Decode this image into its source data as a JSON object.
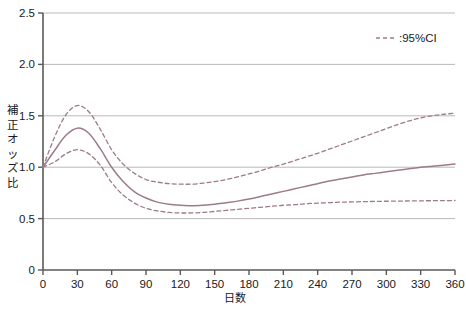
{
  "chart_data": {
    "type": "line",
    "title": "",
    "xlabel": "日数",
    "ylabel": "補正オッズ比",
    "xlim": [
      0,
      360
    ],
    "ylim": [
      0,
      2.5
    ],
    "grid": true,
    "grid_axis": "y",
    "legend": {
      "position": "top-right",
      "entries": [
        {
          "label": ":95%CI",
          "style": "dashed",
          "color": "#9d7a8c"
        }
      ]
    },
    "xticks": [
      0,
      30,
      60,
      90,
      120,
      150,
      180,
      210,
      240,
      270,
      300,
      330,
      360
    ],
    "xtick_labels": [
      "0",
      "30",
      "60",
      "90",
      "120",
      "150",
      "180",
      "210",
      "240",
      "270",
      "300",
      "330",
      "360"
    ],
    "yticks": [
      0,
      0.5,
      1.0,
      1.5,
      2.0,
      2.5
    ],
    "ytick_labels": [
      "0",
      "0.5",
      "1.0",
      "1.5",
      "2.0",
      "2.5"
    ],
    "x": [
      0,
      10,
      20,
      30,
      40,
      50,
      60,
      70,
      80,
      90,
      100,
      110,
      120,
      130,
      140,
      150,
      160,
      170,
      180,
      190,
      200,
      210,
      220,
      230,
      240,
      250,
      260,
      270,
      280,
      290,
      300,
      310,
      320,
      330,
      340,
      350,
      360
    ],
    "series": [
      {
        "name": "補正オッズ比",
        "style": "solid",
        "color": "#9d7a8c",
        "values": [
          1.0,
          1.16,
          1.31,
          1.38,
          1.33,
          1.18,
          1.0,
          0.86,
          0.76,
          0.7,
          0.66,
          0.64,
          0.63,
          0.625,
          0.63,
          0.64,
          0.655,
          0.67,
          0.69,
          0.715,
          0.74,
          0.765,
          0.79,
          0.815,
          0.84,
          0.865,
          0.885,
          0.905,
          0.925,
          0.94,
          0.955,
          0.97,
          0.985,
          1.0,
          1.01,
          1.02,
          1.03
        ]
      },
      {
        "name": "95%CI upper",
        "style": "dashed",
        "color": "#9d7a8c",
        "values": [
          1.0,
          1.29,
          1.51,
          1.6,
          1.54,
          1.37,
          1.17,
          1.03,
          0.94,
          0.88,
          0.855,
          0.84,
          0.835,
          0.835,
          0.845,
          0.86,
          0.88,
          0.905,
          0.935,
          0.965,
          1.0,
          1.03,
          1.065,
          1.1,
          1.135,
          1.175,
          1.215,
          1.255,
          1.295,
          1.335,
          1.375,
          1.415,
          1.45,
          1.48,
          1.5,
          1.515,
          1.525
        ]
      },
      {
        "name": "95%CI lower",
        "style": "dashed",
        "color": "#9d7a8c",
        "values": [
          1.0,
          1.05,
          1.13,
          1.17,
          1.13,
          1.02,
          0.85,
          0.73,
          0.65,
          0.6,
          0.575,
          0.56,
          0.555,
          0.555,
          0.56,
          0.57,
          0.58,
          0.59,
          0.6,
          0.61,
          0.62,
          0.63,
          0.635,
          0.645,
          0.65,
          0.655,
          0.66,
          0.662,
          0.665,
          0.667,
          0.669,
          0.67,
          0.672,
          0.673,
          0.674,
          0.675,
          0.676
        ]
      }
    ]
  },
  "axis": {
    "y_title_chars": [
      "補",
      "正",
      "オ",
      "ッ",
      "ズ",
      "比"
    ]
  },
  "colors": {
    "line": "#9d7a8c",
    "grid": "#b9b9b9",
    "axis": "#595959",
    "text": "#1a1a1a",
    "background": "#ffffff"
  }
}
